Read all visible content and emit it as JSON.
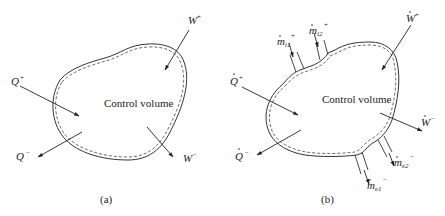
{
  "panels": [
    {
      "id": "a",
      "caption": "(a)",
      "center_label": "Control volume",
      "labels": {
        "w_plus": "W",
        "w_plus_sup": "+",
        "w_minus": "W",
        "w_minus_sup": "−",
        "q_plus": "Q",
        "q_plus_sup": "+",
        "q_minus": "Q",
        "q_minus_sup": "−"
      }
    },
    {
      "id": "b",
      "caption": "(b)",
      "center_label": "Control volume",
      "labels": {
        "w_plus": "W",
        "w_plus_sup": "+",
        "w_minus": "W",
        "w_minus_sup": "−",
        "q_plus": "Q",
        "q_plus_sup": "+",
        "q_minus": "Q",
        "q_minus_sup": "−",
        "mi1": "m",
        "mi1_sub": "i1",
        "mi1_sup": "+",
        "mi2": "m",
        "mi2_sub": "i2",
        "mi2_sup": "+",
        "me1": "m",
        "me1_sub": "e1",
        "me1_sup": "−",
        "me2": "m",
        "me2_sub": "e2",
        "me2_sup": "−"
      }
    }
  ]
}
